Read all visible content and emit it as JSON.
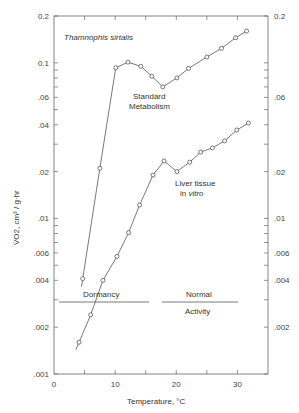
{
  "chart_data": {
    "type": "line",
    "title": "Thamnophis sirtalis",
    "xlabel": "Temperature, °C",
    "ylabel": "V̇O2, cm³ / g·hr",
    "xlim": [
      0,
      35
    ],
    "ylim": [
      0.001,
      0.2
    ],
    "yscale": "log",
    "grid": false,
    "x_ticks": [
      0,
      10,
      20,
      30
    ],
    "y_ticks_left": [
      "0.2",
      "0.1",
      ".06",
      ".04",
      ".02",
      ".01",
      ".006",
      ".004",
      ".002",
      ".001"
    ],
    "y_ticks_right": [
      "0.2",
      ".06",
      ".02",
      ".01",
      ".006",
      ".004",
      ".002"
    ],
    "series": [
      {
        "name": "Standard Metabolism",
        "marker": "open-circle",
        "x": [
          4.7,
          7.5,
          10.1,
          12.1,
          14.2,
          16.0,
          17.8,
          20.1,
          22.0,
          25.0,
          27.4,
          29.7,
          31.5
        ],
        "values": [
          0.0041,
          0.021,
          0.093,
          0.101,
          0.095,
          0.082,
          0.07,
          0.08,
          0.092,
          0.109,
          0.124,
          0.145,
          0.16
        ]
      },
      {
        "name": "Liver tissue in vitro",
        "marker": "open-circle",
        "x": [
          4.1,
          6.0,
          8.0,
          10.3,
          12.2,
          14.0,
          16.2,
          18.0,
          20.1,
          22.2,
          24.0,
          25.9,
          27.9,
          29.9,
          31.8
        ],
        "values": [
          0.0016,
          0.0024,
          0.004,
          0.0057,
          0.0081,
          0.0122,
          0.019,
          0.0234,
          0.02,
          0.023,
          0.0267,
          0.0284,
          0.0315,
          0.037,
          0.041
        ]
      }
    ],
    "annotations": [
      {
        "text": "Standard",
        "line2": "Metabolism"
      },
      {
        "text": "Liver tissue",
        "line2_prefix": "in ",
        "line2_italic": "vitro"
      },
      {
        "text": "Dormancy",
        "range": [
          1,
          15.5
        ],
        "level": 0.003
      },
      {
        "text": "Normal",
        "line2": "Activity",
        "range": [
          17.5,
          30
        ],
        "level": 0.003
      }
    ]
  }
}
